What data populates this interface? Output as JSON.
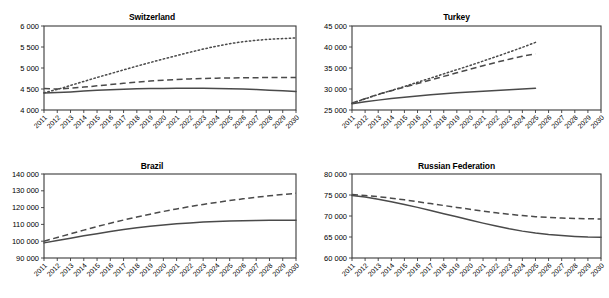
{
  "figure": {
    "panel_count": 4,
    "colors": {
      "line": "#4a4a4a",
      "axis": "#3a3a3a",
      "background": "#ffffff"
    }
  },
  "panels": [
    {
      "title": "Switzerland"
    },
    {
      "title": "Turkey"
    },
    {
      "title": "Brazil"
    },
    {
      "title": "Russian Federation"
    }
  ],
  "chart_data": [
    {
      "type": "line",
      "title": "Switzerland",
      "xlabel": "",
      "ylabel": "",
      "x": [
        2011,
        2012,
        2013,
        2014,
        2015,
        2016,
        2017,
        2018,
        2019,
        2020,
        2021,
        2022,
        2023,
        2024,
        2025,
        2026,
        2027,
        2028,
        2029,
        2030
      ],
      "xlim": [
        2011,
        2030
      ],
      "ylim": [
        4000,
        6000
      ],
      "yticks": [
        4000,
        4500,
        5000,
        5500,
        6000
      ],
      "yticklabels": [
        "4 000",
        "4 500",
        "5 000",
        "5 500",
        "6 000"
      ],
      "xticklabels": [
        "2011",
        "2012",
        "2013",
        "2014",
        "2015",
        "2016",
        "2017",
        "2018",
        "2019",
        "2020",
        "2021",
        "2022",
        "2023",
        "2024",
        "2025",
        "2026",
        "2027",
        "2028",
        "2029",
        "2030"
      ],
      "grid": false,
      "legend": "none",
      "series": [
        {
          "name": "dotted",
          "style": "dotted",
          "values": [
            4410,
            4490,
            4585,
            4680,
            4775,
            4865,
            4955,
            5045,
            5130,
            5215,
            5295,
            5375,
            5450,
            5520,
            5580,
            5625,
            5660,
            5685,
            5700,
            5715
          ]
        },
        {
          "name": "dashed",
          "style": "dashed",
          "values": [
            4510,
            4500,
            4520,
            4545,
            4575,
            4605,
            4635,
            4665,
            4690,
            4710,
            4725,
            4740,
            4750,
            4758,
            4763,
            4767,
            4770,
            4772,
            4774,
            4775
          ]
        },
        {
          "name": "solid",
          "style": "solid",
          "values": [
            4405,
            4415,
            4430,
            4450,
            4468,
            4482,
            4494,
            4503,
            4509,
            4513,
            4516,
            4517,
            4516,
            4513,
            4507,
            4498,
            4486,
            4472,
            4456,
            4440
          ]
        }
      ]
    },
    {
      "type": "line",
      "title": "Turkey",
      "xlabel": "",
      "ylabel": "",
      "x": [
        2011,
        2012,
        2013,
        2014,
        2015,
        2016,
        2017,
        2018,
        2019,
        2020,
        2021,
        2022,
        2023,
        2024,
        2025
      ],
      "xlim": [
        2011,
        2030
      ],
      "ylim": [
        25000,
        45000
      ],
      "yticks": [
        25000,
        30000,
        35000,
        40000,
        45000
      ],
      "yticklabels": [
        "25 000",
        "30 000",
        "35 000",
        "40 000",
        "45 000"
      ],
      "xticklabels": [
        "2011",
        "2012",
        "2013",
        "2014",
        "2015",
        "2016",
        "2017",
        "2018",
        "2019",
        "2020",
        "2021",
        "2022",
        "2023",
        "2024",
        "2025",
        "2026",
        "2027",
        "2028",
        "2029",
        "2030"
      ],
      "grid": false,
      "legend": "none",
      "note": "series terminate at 2025",
      "series": [
        {
          "name": "dotted",
          "style": "dotted",
          "values": [
            26600,
            27650,
            28700,
            29650,
            30600,
            31600,
            32600,
            33600,
            34600,
            35600,
            36650,
            37700,
            38800,
            39900,
            41100
          ]
        },
        {
          "name": "dashed",
          "style": "dashed",
          "values": [
            26650,
            27700,
            28750,
            29600,
            30450,
            31300,
            32150,
            33000,
            33850,
            34700,
            35550,
            36350,
            37100,
            37800,
            38400
          ]
        },
        {
          "name": "solid",
          "style": "solid",
          "values": [
            26500,
            26950,
            27350,
            27720,
            28050,
            28350,
            28630,
            28880,
            29100,
            29300,
            29480,
            29650,
            29820,
            29990,
            30200
          ]
        }
      ]
    },
    {
      "type": "line",
      "title": "Brazil",
      "xlabel": "",
      "ylabel": "",
      "x": [
        2011,
        2012,
        2013,
        2014,
        2015,
        2016,
        2017,
        2018,
        2019,
        2020,
        2021,
        2022,
        2023,
        2024,
        2025,
        2026,
        2027,
        2028,
        2029,
        2030
      ],
      "xlim": [
        2011,
        2030
      ],
      "ylim": [
        90000,
        140000
      ],
      "yticks": [
        90000,
        100000,
        110000,
        120000,
        130000,
        140000
      ],
      "yticklabels": [
        "90 000",
        "100 000",
        "110 000",
        "120 000",
        "130 000",
        "140 000"
      ],
      "xticklabels": [
        "2011",
        "2012",
        "2013",
        "2014",
        "2015",
        "2016",
        "2017",
        "2018",
        "2019",
        "2020",
        "2021",
        "2022",
        "2023",
        "2024",
        "2025",
        "2026",
        "2027",
        "2028",
        "2029",
        "2030"
      ],
      "grid": false,
      "legend": "none",
      "series": [
        {
          "name": "dashed",
          "style": "dashed",
          "values": [
            100000,
            102200,
            104400,
            106600,
            108700,
            110700,
            112600,
            114400,
            116100,
            117700,
            119200,
            120600,
            121900,
            123100,
            124200,
            125200,
            126200,
            127000,
            127800,
            128500
          ]
        },
        {
          "name": "solid",
          "style": "solid",
          "values": [
            99000,
            100400,
            101800,
            103200,
            104500,
            105800,
            106900,
            108000,
            108900,
            109700,
            110400,
            110900,
            111400,
            111700,
            112000,
            112200,
            112350,
            112450,
            112500,
            112500
          ]
        }
      ]
    },
    {
      "type": "line",
      "title": "Russian Federation",
      "xlabel": "",
      "ylabel": "",
      "x": [
        2011,
        2012,
        2013,
        2014,
        2015,
        2016,
        2017,
        2018,
        2019,
        2020,
        2021,
        2022,
        2023,
        2024,
        2025,
        2026,
        2027,
        2028,
        2029,
        2030
      ],
      "xlim": [
        2011,
        2030
      ],
      "ylim": [
        60000,
        80000
      ],
      "yticks": [
        60000,
        65000,
        70000,
        75000,
        80000
      ],
      "yticklabels": [
        "60 000",
        "65 000",
        "70 000",
        "75 000",
        "80 000"
      ],
      "xticklabels": [
        "2011",
        "2012",
        "2013",
        "2014",
        "2015",
        "2016",
        "2017",
        "2018",
        "2019",
        "2020",
        "2021",
        "2022",
        "2023",
        "2024",
        "2025",
        "2026",
        "2027",
        "2028",
        "2029",
        "2030"
      ],
      "grid": false,
      "legend": "none",
      "series": [
        {
          "name": "dashed",
          "style": "dashed",
          "values": [
            75100,
            74900,
            74600,
            74250,
            73850,
            73400,
            72950,
            72500,
            72050,
            71600,
            71150,
            70750,
            70400,
            70100,
            69850,
            69650,
            69500,
            69400,
            69330,
            69300
          ]
        },
        {
          "name": "solid",
          "style": "solid",
          "values": [
            74900,
            74500,
            74000,
            73400,
            72750,
            72050,
            71300,
            70550,
            69800,
            69050,
            68300,
            67600,
            66950,
            66400,
            65950,
            65600,
            65330,
            65130,
            65000,
            64950
          ]
        }
      ]
    }
  ]
}
